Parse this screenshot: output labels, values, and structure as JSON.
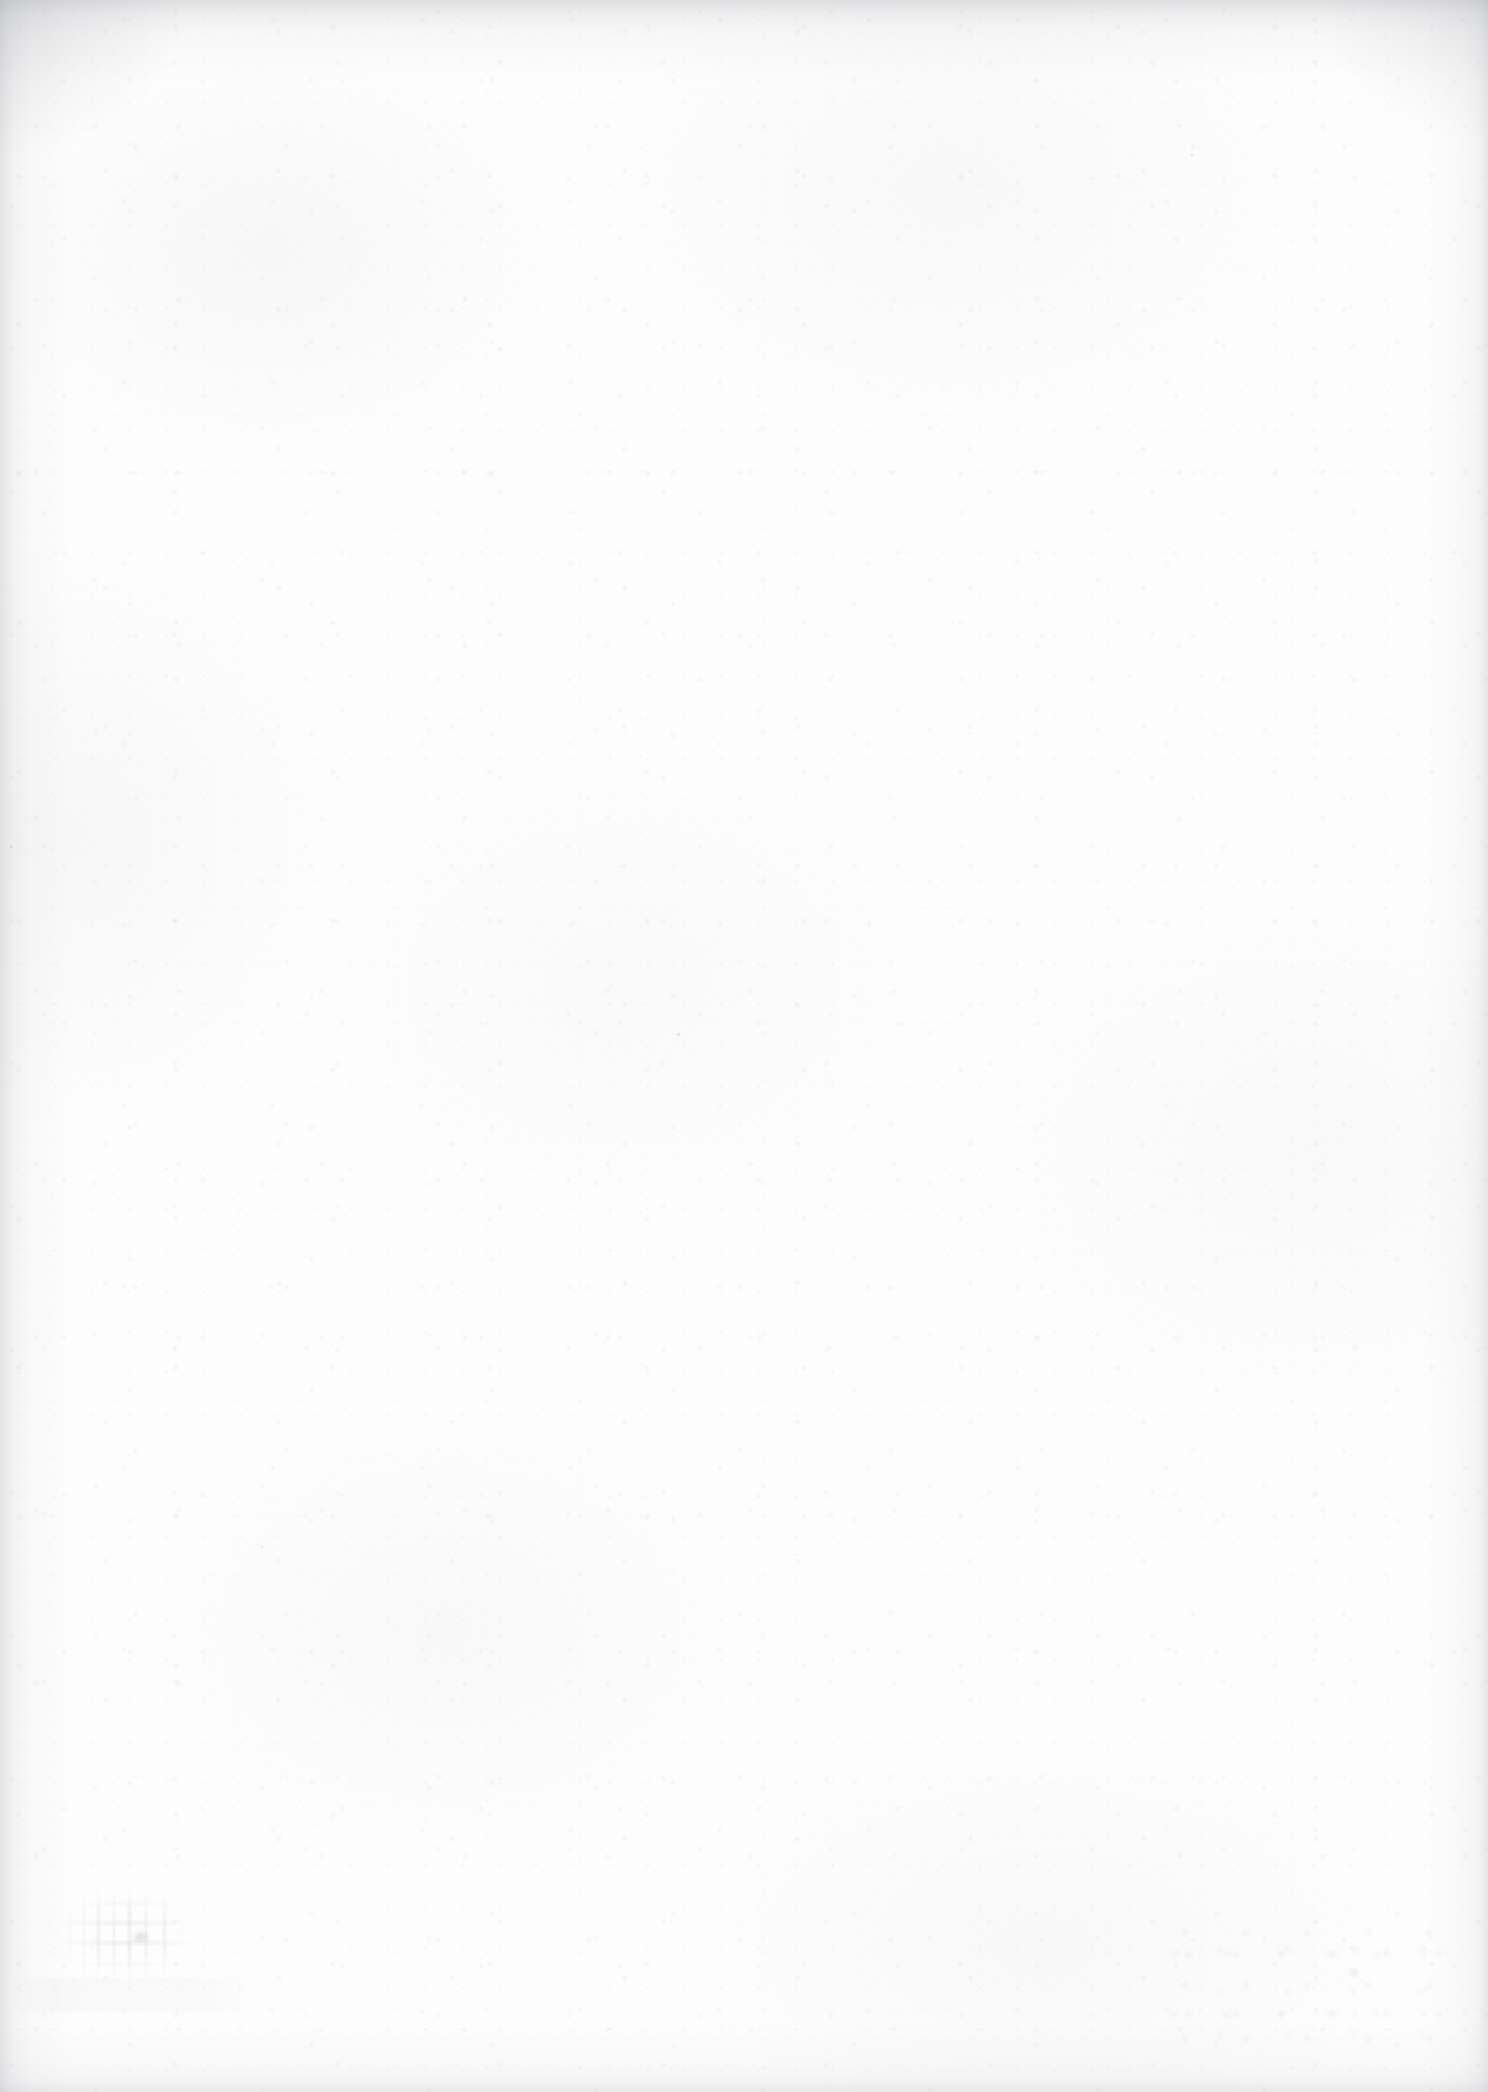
{
  "page": {
    "kind": "scanned-page",
    "orientation": "portrait",
    "width_px": 1488,
    "height_px": 2092,
    "is_blank": true,
    "visible_text": "",
    "text_blocks": [],
    "page_number": "",
    "header": "",
    "footer": "",
    "paper_color": "#fdfdfd",
    "ink_color": "#8c8e96",
    "edge_shadow_color": "#96989e"
  },
  "artifacts": [
    {
      "id": "setoff-lower-left",
      "label": "set-off ink ghost",
      "legible": false,
      "text": "",
      "region": {
        "x": 38,
        "y": 1876,
        "width": 176,
        "height": 118
      }
    },
    {
      "id": "setoff-blob",
      "label": "dark ink nucleus",
      "legible": false,
      "text": "",
      "region": {
        "x": 128,
        "y": 1928,
        "width": 26,
        "height": 18
      }
    },
    {
      "id": "setoff-band",
      "label": "faint smudge band",
      "legible": false,
      "text": "",
      "region": {
        "x": 10,
        "y": 1978,
        "width": 250,
        "height": 34
      }
    },
    {
      "id": "smudge-bottom-right",
      "label": "scanner speckle smudge",
      "legible": false,
      "text": "",
      "region": {
        "x": 1168,
        "y": 1918,
        "width": 300,
        "height": 130
      }
    }
  ]
}
